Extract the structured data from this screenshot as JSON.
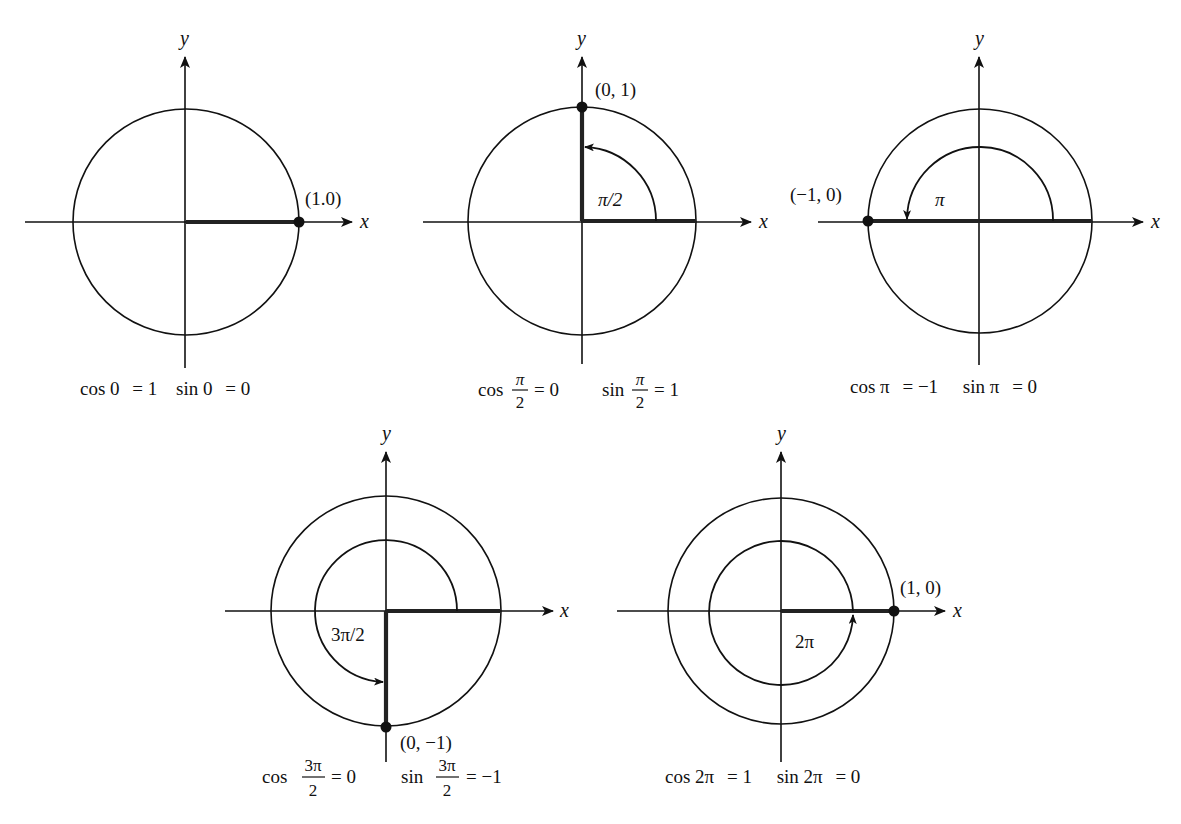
{
  "figure": {
    "colors": {
      "ink": "#111111",
      "radius_highlight": "#222222",
      "background": "#ffffff"
    },
    "axis_labels": {
      "x": "x",
      "y": "y"
    },
    "panels": [
      {
        "id": "angle-0",
        "angle": "0",
        "angle_label": "",
        "point_label": "(1.0)",
        "point": [
          1,
          0
        ],
        "caption": {
          "cos_lhs": "cos 0",
          "cos_rhs": "= 1",
          "sin_lhs": "sin 0",
          "sin_rhs": "= 0"
        }
      },
      {
        "id": "angle-pi-over-2",
        "angle": "π/2",
        "angle_label": "π/2",
        "point_label": "(0, 1)",
        "point": [
          0,
          1
        ],
        "caption": {
          "cos_prefix": "cos",
          "cos_num": "π",
          "cos_den": "2",
          "cos_rhs": "= 0",
          "sin_prefix": "sin",
          "sin_num": "π",
          "sin_den": "2",
          "sin_rhs": "= 1"
        }
      },
      {
        "id": "angle-pi",
        "angle": "π",
        "angle_label": "π",
        "point_label": "(−1, 0)",
        "point": [
          -1,
          0
        ],
        "caption": {
          "cos_lhs": "cos π",
          "cos_rhs": "= −1",
          "sin_lhs": "sin π",
          "sin_rhs": "= 0"
        }
      },
      {
        "id": "angle-3pi-over-2",
        "angle": "3π/2",
        "angle_label": "3π/2",
        "point_label": "(0, −1)",
        "point": [
          0,
          -1
        ],
        "caption": {
          "cos_prefix": "cos",
          "cos_num": "3π",
          "cos_den": "2",
          "cos_rhs": "= 0",
          "sin_prefix": "sin",
          "sin_num": "3π",
          "sin_den": "2",
          "sin_rhs": "= −1"
        }
      },
      {
        "id": "angle-2pi",
        "angle": "2π",
        "angle_label": "2π",
        "point_label": "(1, 0)",
        "point": [
          1,
          0
        ],
        "caption": {
          "cos_lhs": "cos 2π",
          "cos_rhs": "= 1",
          "sin_lhs": "sin 2π",
          "sin_rhs": "= 0"
        }
      }
    ]
  }
}
